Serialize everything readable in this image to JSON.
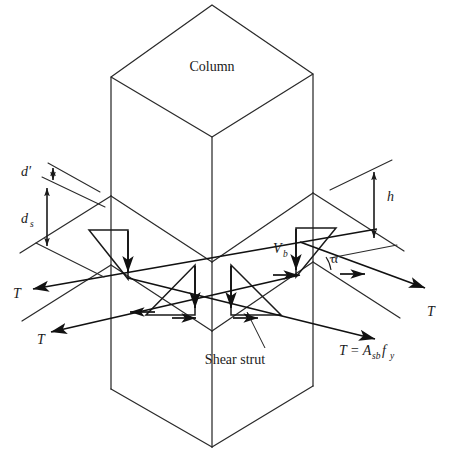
{
  "figure": {
    "domain": "diagram",
    "kind": "engineering-isometric-sketch",
    "background_color": "#ffffff",
    "line_color": "#2a2a2a",
    "text_color": "#1a1a1a"
  },
  "labels": {
    "column": "Column",
    "shear_strut": "Shear strut",
    "shear_force": "V",
    "shear_force_sub": "b",
    "angle": "α",
    "tension_left_upper": "T",
    "tension_left_lower": "T",
    "tension_right_upper": "T",
    "tension_right_lower_eq": {
      "lead": "T = A",
      "lead_sub": "sb",
      "tail": " f",
      "tail_sub": "y"
    },
    "dim_d_prime": "d′",
    "dim_ds": "d",
    "dim_ds_sub": "s",
    "dim_h": "h"
  },
  "geometry": {
    "column_top_face": {
      "apex": [
        212,
        5
      ],
      "left": [
        111,
        77
      ],
      "right": [
        313,
        74
      ],
      "front": [
        212,
        137
      ]
    },
    "column_left_edge_x": 111,
    "column_right_edge_x": 313,
    "column_front_edge_x": 212,
    "column_bottom_y": 447,
    "slab_top_left": [
      111,
      196
    ],
    "slab_top_front": [
      212,
      262
    ],
    "slab_top_right": [
      313,
      193
    ],
    "slab_bottom_left": [
      111,
      265
    ],
    "slab_bottom_front": [
      212,
      331
    ],
    "slab_bottom_right": [
      313,
      262
    ]
  },
  "dimensions": {
    "d_prime_value_shown": false,
    "d_s_value_shown": false,
    "h_value_shown": false,
    "alpha_value_shown": false
  }
}
